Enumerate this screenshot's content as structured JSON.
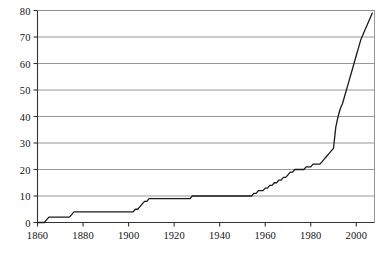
{
  "chart_data": {
    "type": "line",
    "title": "",
    "subtitle": "",
    "xlabel": "",
    "ylabel": "",
    "xlim": [
      1860,
      2008
    ],
    "ylim": [
      0,
      80
    ],
    "grid": "horizontal",
    "legend": "none",
    "x_ticks": [
      1860,
      1880,
      1900,
      1920,
      1940,
      1960,
      1980,
      2000
    ],
    "x_tick_labels": [
      "1860",
      "1880",
      "1900",
      "1920",
      "1940",
      "1960",
      "1980",
      "2000"
    ],
    "y_ticks": [
      0,
      10,
      20,
      30,
      40,
      50,
      60,
      70,
      80
    ],
    "y_tick_labels": [
      "0",
      "10",
      "20",
      "30",
      "40",
      "50",
      "60",
      "70",
      "80"
    ],
    "series": [
      {
        "name": "cumulative-count",
        "style": "step",
        "color": "#1a1a1a",
        "x": [
          1860,
          1863,
          1864,
          1865,
          1866,
          1874,
          1875,
          1876,
          1877,
          1886,
          1898,
          1902,
          1903,
          1904,
          1905,
          1906,
          1907,
          1908,
          1909,
          1910,
          1911,
          1918,
          1925,
          1926,
          1927,
          1928,
          1929,
          1930,
          1936,
          1944,
          1952,
          1954,
          1955,
          1956,
          1957,
          1958,
          1959,
          1960,
          1961,
          1962,
          1963,
          1964,
          1965,
          1966,
          1967,
          1968,
          1969,
          1970,
          1971,
          1972,
          1973,
          1974,
          1975,
          1976,
          1977,
          1978,
          1979,
          1980,
          1981,
          1982,
          1983,
          1984,
          1985,
          1986,
          1987,
          1988,
          1989,
          1990,
          1991,
          1992,
          1993,
          1994,
          1995,
          1996,
          1997,
          1998,
          1999,
          2000,
          2001,
          2002,
          2003,
          2004,
          2005,
          2006,
          2007
        ],
        "y": [
          0,
          0,
          1,
          2,
          2,
          2,
          3,
          4,
          4,
          4,
          4,
          4,
          5,
          5,
          6,
          7,
          8,
          8,
          9,
          9,
          9,
          9,
          9,
          9,
          9,
          10,
          10,
          10,
          10,
          10,
          10,
          10,
          11,
          11,
          12,
          12,
          12,
          13,
          13,
          14,
          14,
          15,
          15,
          16,
          16,
          17,
          17,
          18,
          19,
          19,
          20,
          20,
          20,
          20,
          20,
          21,
          21,
          21,
          22,
          22,
          22,
          22,
          23,
          24,
          25,
          26,
          27,
          28,
          36,
          40,
          43,
          45,
          48,
          51,
          54,
          57,
          60,
          63,
          66,
          69,
          71,
          73,
          75,
          77,
          79
        ]
      }
    ]
  },
  "axes": {
    "left_axis_name": "y-axis",
    "bottom_axis_name": "x-axis"
  },
  "colors": {
    "line": "#1a1a1a",
    "gridline": "#8c8c8c",
    "axis": "#333333",
    "background": "#ffffff"
  }
}
